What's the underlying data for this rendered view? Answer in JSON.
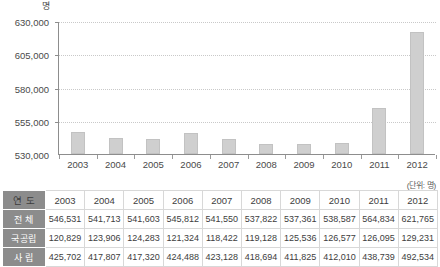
{
  "chart_data": {
    "type": "bar",
    "title": "",
    "subtitle": "",
    "xlabel": "",
    "ylabel": "명",
    "unit_note": "(단위: 명)",
    "categories": [
      "2003",
      "2004",
      "2005",
      "2006",
      "2007",
      "2008",
      "2009",
      "2010",
      "2011",
      "2012"
    ],
    "values": [
      546531,
      541713,
      541603,
      545812,
      541550,
      537822,
      537361,
      538587,
      564834,
      621765
    ],
    "series": [
      {
        "name": "전 체",
        "values": [
          546531,
          541713,
          541603,
          545812,
          541550,
          537822,
          537361,
          538587,
          564834,
          621765
        ]
      }
    ],
    "ylim": [
      530000,
      630000
    ],
    "yticks": [
      530000,
      555000,
      580000,
      605000,
      630000
    ],
    "ytick_labels": [
      "530,000",
      "555,000",
      "580,000",
      "605,000",
      "630,000"
    ],
    "grid": true,
    "legend": "none",
    "bar_color": "#cfcfcf"
  },
  "table": {
    "unit_note": "(단위: 명)",
    "row_headers": [
      "연 도",
      "전 체",
      "국공립",
      "사 립"
    ],
    "years": [
      "2003",
      "2004",
      "2005",
      "2006",
      "2007",
      "2008",
      "2009",
      "2010",
      "2011",
      "2012"
    ],
    "rows": [
      {
        "label": "전 체",
        "values": [
          "546,531",
          "541,713",
          "541,603",
          "545,812",
          "541,550",
          "537,822",
          "537,361",
          "538,587",
          "564,834",
          "621,765"
        ]
      },
      {
        "label": "국공립",
        "values": [
          "120,829",
          "123,906",
          "124,283",
          "121,324",
          "118,422",
          "119,128",
          "125,536",
          "126,577",
          "126,095",
          "129,231"
        ]
      },
      {
        "label": "사 립",
        "values": [
          "425,702",
          "417,807",
          "417,320",
          "424,488",
          "423,128",
          "418,694",
          "411,825",
          "412,010",
          "438,739",
          "492,534"
        ]
      }
    ]
  },
  "colors": {
    "bar": "#cfcfcf",
    "bar_border": "#c2c2c2",
    "axis": "#8d8d8d",
    "gridline": "#c9c9c9",
    "row_header_bg": "#8c8c8c",
    "table_border": "#d8d8d8",
    "text": "#3d3d3d"
  }
}
